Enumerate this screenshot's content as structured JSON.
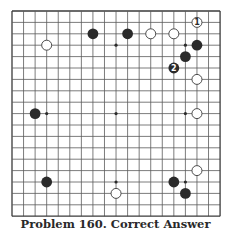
{
  "board": {
    "size": 19,
    "origin_x": 12,
    "origin_y": 11,
    "cell_w": 11.56,
    "cell_h": 11.4,
    "line_color": "#5a5a5a",
    "border_color": "#3a3a3a",
    "black_color": "#2b2b2b",
    "white_fill": "#ffffff",
    "white_stroke": "#3a3a3a",
    "star_points": [
      [
        3,
        3
      ],
      [
        9,
        3
      ],
      [
        15,
        3
      ],
      [
        3,
        9
      ],
      [
        9,
        9
      ],
      [
        15,
        9
      ],
      [
        3,
        15
      ],
      [
        9,
        15
      ],
      [
        15,
        15
      ]
    ],
    "stones": [
      {
        "color": "black",
        "col": 7,
        "row": 2
      },
      {
        "color": "black",
        "col": 10,
        "row": 2
      },
      {
        "color": "white",
        "col": 12,
        "row": 2
      },
      {
        "color": "white",
        "col": 14,
        "row": 2
      },
      {
        "color": "white",
        "col": 3,
        "row": 3
      },
      {
        "color": "white",
        "col": 16,
        "row": 1,
        "label": "1"
      },
      {
        "color": "black",
        "col": 16,
        "row": 3
      },
      {
        "color": "black",
        "col": 15,
        "row": 4
      },
      {
        "color": "black",
        "col": 14,
        "row": 5,
        "label": "2"
      },
      {
        "color": "white",
        "col": 16,
        "row": 6
      },
      {
        "color": "black",
        "col": 2,
        "row": 9
      },
      {
        "color": "white",
        "col": 16,
        "row": 9
      },
      {
        "color": "white",
        "col": 16,
        "row": 14
      },
      {
        "color": "black",
        "col": 3,
        "row": 15
      },
      {
        "color": "black",
        "col": 14,
        "row": 15
      },
      {
        "color": "white",
        "col": 9,
        "row": 16
      },
      {
        "color": "black",
        "col": 15,
        "row": 16
      }
    ]
  },
  "caption": "Problem 160. Correct Answer"
}
